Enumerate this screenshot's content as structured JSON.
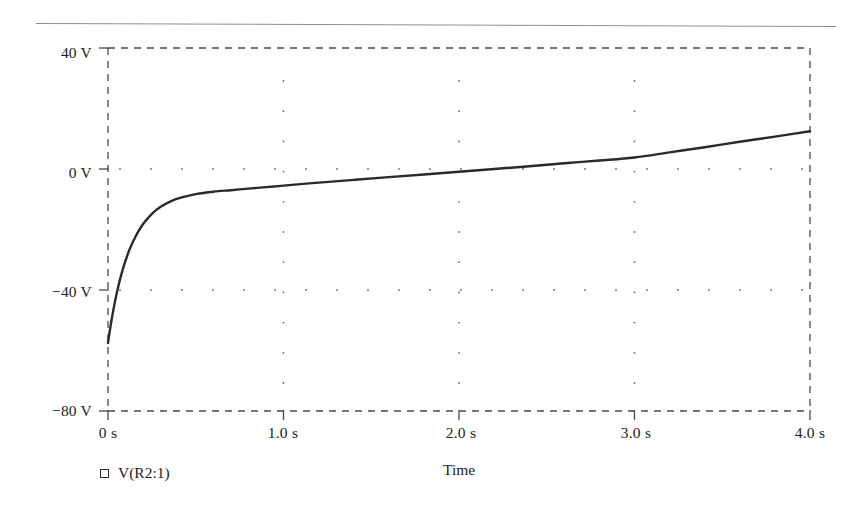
{
  "window": {
    "title": "Transient Analysis Plot"
  },
  "separator": {
    "name": "top-horizontal-rule"
  },
  "axes": {
    "y": {
      "title": "",
      "unit": "V",
      "ticks": [
        "40 V",
        "0 V",
        "−40 V",
        "−80 V"
      ],
      "tick_values": [
        40,
        0,
        -40,
        -80
      ],
      "min": -80,
      "max": 40
    },
    "x": {
      "title": "Time",
      "unit": "s",
      "ticks": [
        "0 s",
        "1.0 s",
        "2.0 s",
        "3.0 s",
        "4.0 s"
      ],
      "tick_values": [
        0,
        1,
        2,
        3,
        4
      ],
      "min": 0,
      "max": 4
    }
  },
  "legend": {
    "marker": "open-square",
    "label": "V(R2:1)"
  },
  "style": {
    "trace_color": "#2a2a2a",
    "border_color": "#4a4a4a",
    "grid_color": "#6d6d6d",
    "text_color": "#1b1b1b",
    "background": "#ffffff"
  },
  "chart_data": {
    "type": "line",
    "title": "",
    "xlabel": "Time",
    "ylabel": "",
    "xlim": [
      0,
      4
    ],
    "ylim": [
      -80,
      40
    ],
    "xticks": [
      0,
      1,
      2,
      3,
      4
    ],
    "xticklabels": [
      "0 s",
      "1.0 s",
      "2.0 s",
      "3.0 s",
      "4.0 s"
    ],
    "yticks": [
      -80,
      -40,
      0,
      40
    ],
    "yticklabels": [
      "−80 V",
      "−40 V",
      "0 V",
      "40 V"
    ],
    "grid": "dotted-interior-dashed-border",
    "legend_position": "below-axes-left",
    "series": [
      {
        "name": "V(R2:1)",
        "x": [
          0.0,
          0.02,
          0.05,
          0.08,
          0.12,
          0.16,
          0.2,
          0.25,
          0.3,
          0.36,
          0.42,
          0.5,
          0.6,
          0.7,
          0.8,
          0.9,
          1.0,
          1.2,
          1.4,
          1.6,
          1.8,
          2.0,
          2.2,
          2.4,
          2.6,
          2.8,
          3.0,
          3.2,
          3.4,
          3.6,
          3.8,
          4.0
        ],
        "y": [
          -57.5,
          -50.0,
          -41.0,
          -34.0,
          -27.0,
          -22.0,
          -18.2,
          -14.8,
          -12.5,
          -10.6,
          -9.4,
          -8.3,
          -7.5,
          -7.0,
          -6.5,
          -6.0,
          -5.5,
          -4.5,
          -3.6,
          -2.7,
          -1.8,
          -0.9,
          0.0,
          0.9,
          1.9,
          2.8,
          3.8,
          5.5,
          7.2,
          9.0,
          10.7,
          12.5
        ]
      }
    ]
  }
}
